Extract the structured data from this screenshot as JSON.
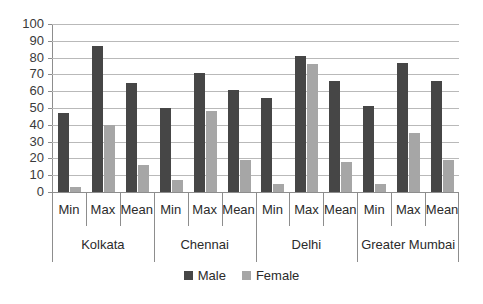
{
  "chart_data": {
    "type": "bar",
    "title": "",
    "subtitle": "",
    "xlabel": "",
    "ylabel": "",
    "ylim": [
      0,
      100
    ],
    "ytick_step": 10,
    "yticks": [
      100,
      90,
      80,
      70,
      60,
      50,
      40,
      30,
      20,
      10,
      0
    ],
    "grid": true,
    "legend_position": "bottom",
    "groups": [
      "Kolkata",
      "Chennai",
      "Delhi",
      "Greater Mumbai"
    ],
    "categories": [
      "Min",
      "Max",
      "Mean",
      "Min",
      "Max",
      "Mean",
      "Min",
      "Max",
      "Mean",
      "Min",
      "Max",
      "Mean"
    ],
    "series": [
      {
        "name": "Male",
        "color": "#464646",
        "values": [
          47,
          87,
          65,
          50,
          71,
          61,
          56,
          81,
          66,
          51,
          77,
          66
        ]
      },
      {
        "name": "Female",
        "color": "#a6a6a6",
        "values": [
          3,
          40,
          16,
          7,
          48,
          19,
          5,
          76,
          18,
          5,
          35,
          19
        ]
      }
    ],
    "by_group": [
      {
        "group": "Kolkata",
        "Min": {
          "Male": 47,
          "Female": 3
        },
        "Max": {
          "Male": 87,
          "Female": 40
        },
        "Mean": {
          "Male": 65,
          "Female": 16
        }
      },
      {
        "group": "Chennai",
        "Min": {
          "Male": 50,
          "Female": 7
        },
        "Max": {
          "Male": 71,
          "Female": 48
        },
        "Mean": {
          "Male": 61,
          "Female": 19
        }
      },
      {
        "group": "Delhi",
        "Min": {
          "Male": 56,
          "Female": 5
        },
        "Max": {
          "Male": 81,
          "Female": 76
        },
        "Mean": {
          "Male": 66,
          "Female": 18
        }
      },
      {
        "group": "Greater Mumbai",
        "Min": {
          "Male": 51,
          "Female": 5
        },
        "Max": {
          "Male": 77,
          "Female": 35
        },
        "Mean": {
          "Male": 66,
          "Female": 19
        }
      }
    ]
  },
  "legend": {
    "items": [
      {
        "label": "Male",
        "color": "#464646"
      },
      {
        "label": "Female",
        "color": "#a6a6a6"
      }
    ]
  },
  "colors": {
    "male": "#464646",
    "female": "#a6a6a6",
    "gridline": "#b9b9b9",
    "axis": "#8d8d8d",
    "text": "#2b2b2b",
    "background": "#ffffff"
  }
}
